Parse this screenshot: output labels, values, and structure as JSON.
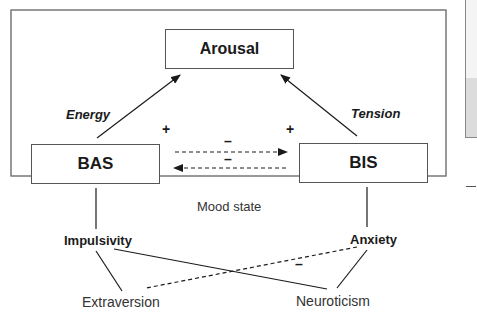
{
  "diagram": {
    "nodes": {
      "arousal": "Arousal",
      "bas": "BAS",
      "bis": "BIS",
      "impulsivity": "Impulsivity",
      "anxiety": "Anxiety",
      "extraversion": "Extraversion",
      "neuroticism": "Neuroticism",
      "mood_state": "Mood state"
    },
    "edge_labels": {
      "energy": "Energy",
      "tension": "Tension",
      "bas_plus": "+",
      "bis_plus": "+",
      "bas_to_bis_minus": "–",
      "bis_to_bas_minus": "–",
      "anxiety_extraversion_minus": "–"
    },
    "colors": {
      "line": "#1a1a1a",
      "border": "#555555"
    }
  }
}
